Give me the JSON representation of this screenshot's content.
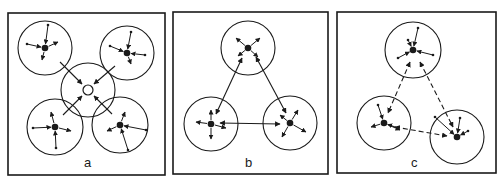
{
  "figure": {
    "colors": {
      "ink": "#1a1a1a",
      "background": "#ffffff"
    },
    "panels": [
      {
        "id": "a",
        "label": "a",
        "frame": {
          "x": 8,
          "y": 13,
          "w": 157,
          "h": 162
        },
        "label_pos": {
          "x": 88,
          "y": 167
        },
        "clusters": [
          {
            "cx": 45,
            "cy": 48,
            "r": 27,
            "node": "filled",
            "spokes": [
              [
                48,
                25,
                "in"
              ],
              [
                27,
                44,
                "in"
              ],
              [
                58,
                42,
                "out"
              ],
              [
                42,
                60,
                "out"
              ]
            ]
          },
          {
            "cx": 127,
            "cy": 53,
            "r": 27,
            "node": "filled",
            "spokes": [
              [
                131,
                32,
                "in"
              ],
              [
                110,
                46,
                "in"
              ],
              [
                145,
                55,
                "in"
              ],
              [
                131,
                64,
                "out"
              ]
            ]
          },
          {
            "cx": 88,
            "cy": 90,
            "r": 27,
            "node": "hollow",
            "spokes": []
          },
          {
            "cx": 55,
            "cy": 127,
            "r": 28,
            "node": "filled",
            "spokes": [
              [
                51,
                112,
                "out"
              ],
              [
                33,
                128,
                "in"
              ],
              [
                71,
                131,
                "out"
              ],
              [
                56,
                148,
                "in"
              ]
            ]
          },
          {
            "cx": 120,
            "cy": 125,
            "r": 28,
            "node": "filled",
            "spokes": [
              [
                125,
                112,
                "out"
              ],
              [
                107,
                131,
                "out"
              ],
              [
                146,
                130,
                "in"
              ],
              [
                128,
                150,
                "in"
              ]
            ]
          }
        ],
        "links": [
          {
            "from": [
              60,
              62
            ],
            "to": [
              82,
              84
            ],
            "style": "solid",
            "heads": "end"
          },
          {
            "from": [
              115,
              66
            ],
            "to": [
              94,
              84
            ],
            "style": "solid",
            "heads": "end"
          },
          {
            "from": [
              63,
              115
            ],
            "to": [
              82,
              96
            ],
            "style": "solid",
            "heads": "end"
          },
          {
            "from": [
              112,
              114
            ],
            "to": [
              94,
              96
            ],
            "style": "solid",
            "heads": "end"
          }
        ]
      },
      {
        "id": "b",
        "label": "b",
        "frame": {
          "x": 173,
          "y": 12,
          "w": 155,
          "h": 162
        },
        "label_pos": {
          "x": 249,
          "y": 167
        },
        "clusters": [
          {
            "cx": 248,
            "cy": 48,
            "r": 27,
            "node": "filled",
            "spokes": [
              [
                236,
                38,
                "out"
              ],
              [
                260,
                38,
                "out"
              ],
              [
                238,
                56,
                "out"
              ],
              [
                258,
                57,
                "out"
              ]
            ]
          },
          {
            "cx": 211,
            "cy": 124,
            "r": 27,
            "node": "filled",
            "spokes": [
              [
                211,
                110,
                "out"
              ],
              [
                196,
                122,
                "out"
              ],
              [
                226,
                128,
                "out"
              ],
              [
                211,
                139,
                "out"
              ]
            ]
          },
          {
            "cx": 290,
            "cy": 123,
            "r": 27,
            "node": "filled",
            "spokes": [
              [
                280,
                115,
                "out"
              ],
              [
                298,
                110,
                "out"
              ],
              [
                306,
                132,
                "out"
              ],
              [
                282,
                137,
                "out"
              ]
            ]
          }
        ],
        "links": [
          {
            "from": [
              242,
              58
            ],
            "to": [
              216,
              114
            ],
            "style": "solid",
            "heads": "both"
          },
          {
            "from": [
              256,
              57
            ],
            "to": [
              286,
              113
            ],
            "style": "solid",
            "heads": "both"
          },
          {
            "from": [
              220,
              123
            ],
            "to": [
              280,
              124
            ],
            "style": "solid",
            "heads": "both"
          }
        ]
      },
      {
        "id": "c",
        "label": "c",
        "frame": {
          "x": 337,
          "y": 12,
          "w": 159,
          "h": 161
        },
        "label_pos": {
          "x": 415,
          "y": 167
        },
        "clusters": [
          {
            "cx": 413,
            "cy": 50,
            "r": 28,
            "node": "filled",
            "spokes": [
              [
                418,
                28,
                "in"
              ],
              [
                408,
                40,
                "in"
              ],
              [
                398,
                58,
                "in"
              ],
              [
                433,
                55,
                "in"
              ]
            ]
          },
          {
            "cx": 384,
            "cy": 123,
            "r": 27,
            "node": "filled",
            "spokes": [
              [
                378,
                105,
                "in"
              ],
              [
                371,
                127,
                "out"
              ],
              [
                398,
                128,
                "in"
              ],
              [
                400,
                130,
                "out"
              ]
            ]
          },
          {
            "cx": 457,
            "cy": 137,
            "r": 27,
            "node": "filled",
            "spokes": [
              [
                435,
                117,
                "in"
              ],
              [
                460,
                118,
                "in"
              ],
              [
                468,
                131,
                "in"
              ]
            ]
          }
        ],
        "links": [
          {
            "from": [
              410,
              62
            ],
            "to": [
              388,
              113
            ],
            "style": "dashed",
            "heads": "end-start",
            "head_at": "both"
          },
          {
            "from": [
              420,
              62
            ],
            "to": [
              453,
              127
            ],
            "style": "dashed",
            "heads": "both"
          },
          {
            "from": [
              395,
              127
            ],
            "to": [
              447,
              136
            ],
            "style": "dashed",
            "heads": "both"
          }
        ]
      }
    ]
  }
}
